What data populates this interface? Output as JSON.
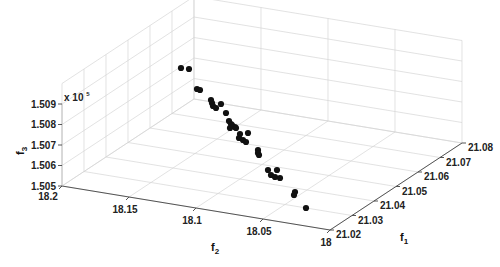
{
  "chart_data": {
    "type": "scatter3d",
    "title": "",
    "xlabel": "f_1",
    "ylabel": "f_2",
    "zlabel": "f_3",
    "z_multiplier": "x 10^5",
    "xlim": [
      21.02,
      21.08
    ],
    "ylim": [
      18.0,
      18.2
    ],
    "zlim": [
      1.505,
      1.509
    ],
    "x_ticks": [
      "21.02",
      "21.03",
      "21.04",
      "21.05",
      "21.06",
      "21.07",
      "21.08"
    ],
    "y_ticks": [
      "18",
      "18.05",
      "18.1",
      "18.15",
      "18.2"
    ],
    "z_ticks": [
      "1.505",
      "1.506",
      "1.507",
      "1.508",
      "1.509"
    ],
    "grid": true,
    "marker_color": "#111111",
    "points_screen": [
      [
        181,
        68
      ],
      [
        189,
        69
      ],
      [
        197,
        89
      ],
      [
        200,
        90
      ],
      [
        211,
        100
      ],
      [
        212,
        103
      ],
      [
        213,
        106
      ],
      [
        216,
        108
      ],
      [
        221,
        104
      ],
      [
        226,
        113
      ],
      [
        229,
        121
      ],
      [
        231,
        124
      ],
      [
        235,
        127
      ],
      [
        230,
        128
      ],
      [
        240,
        134
      ],
      [
        232,
        125
      ],
      [
        236,
        128
      ],
      [
        248,
        133
      ],
      [
        239,
        138
      ],
      [
        243,
        140
      ],
      [
        246,
        142
      ],
      [
        258,
        150
      ],
      [
        258,
        153
      ],
      [
        259,
        155
      ],
      [
        268,
        170
      ],
      [
        277,
        170
      ],
      [
        271,
        175
      ],
      [
        275,
        177
      ],
      [
        280,
        178
      ],
      [
        295,
        192
      ],
      [
        294,
        195
      ],
      [
        306,
        208
      ]
    ]
  },
  "labels": {
    "cut_top_text": "",
    "exponent_base": "x 10",
    "exponent_power": "5",
    "f1_main": "f",
    "f1_sub": "1",
    "f2_main": "f",
    "f2_sub": "2",
    "f3_main": "f",
    "f3_sub": "3"
  }
}
